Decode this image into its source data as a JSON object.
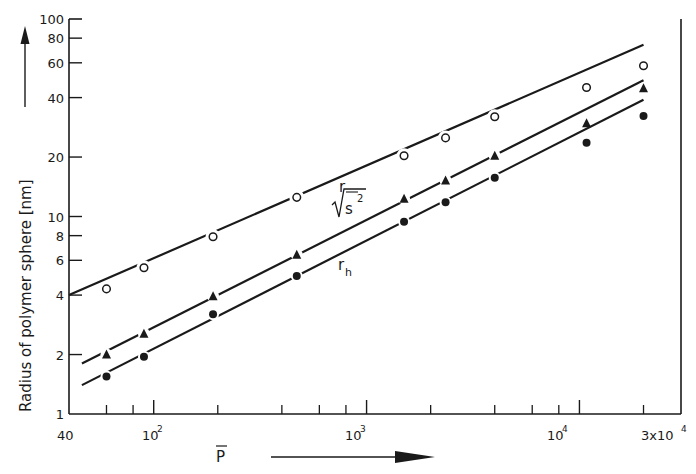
{
  "chart_data": {
    "type": "scatter",
    "title": "",
    "xlabel": "P̄",
    "ylabel": "Radius of polymer sphere [nm]",
    "xscale": "log",
    "yscale": "log",
    "xlim": [
      40,
      30000
    ],
    "ylim": [
      1,
      100
    ],
    "grid": false,
    "legend": "inline curve labels",
    "x_ticks_major": [
      {
        "value": 100,
        "label": "10²"
      },
      {
        "value": 1000,
        "label": "10³"
      },
      {
        "value": 10000,
        "label": "10⁴"
      }
    ],
    "x_tick_edge_labels": [
      {
        "value": 40,
        "label": "40"
      },
      {
        "value": 30000,
        "label": "3x10⁴"
      }
    ],
    "x_ticks_minor": [
      60,
      80,
      200,
      400,
      600,
      800,
      2000,
      4000,
      6000,
      8000,
      20000
    ],
    "y_ticks": [
      {
        "value": 1,
        "label": "1"
      },
      {
        "value": 2,
        "label": "2"
      },
      {
        "value": 4,
        "label": "4"
      },
      {
        "value": 6,
        "label": "6"
      },
      {
        "value": 8,
        "label": "8"
      },
      {
        "value": 10,
        "label": "10"
      },
      {
        "value": 20,
        "label": "20"
      },
      {
        "value": 40,
        "label": "40"
      },
      {
        "value": 60,
        "label": "60"
      },
      {
        "value": 80,
        "label": "80"
      },
      {
        "value": 100,
        "label": "100"
      }
    ],
    "x": [
      60,
      90,
      190,
      470,
      1500,
      2350,
      4000,
      10800,
      20000
    ],
    "series": [
      {
        "name": "r",
        "marker": "open-circle",
        "values": [
          4.3,
          5.5,
          7.9,
          12.5,
          20.3,
          25,
          32,
          45,
          58
        ],
        "fit_line": {
          "x": [
            40,
            20000
          ],
          "y": [
            4.0,
            74
          ]
        }
      },
      {
        "name": "√s̄²",
        "marker": "filled-triangle",
        "values": [
          2.0,
          2.55,
          3.95,
          6.4,
          12.3,
          15.2,
          20.3,
          29.7,
          44.6
        ],
        "fit_line": {
          "x": [
            46,
            20000
          ],
          "y": [
            1.8,
            49
          ]
        }
      },
      {
        "name": "r_h",
        "marker": "filled-circle",
        "values": [
          1.55,
          1.95,
          3.2,
          5.0,
          9.4,
          11.8,
          15.7,
          23.6,
          32.3
        ],
        "fit_line": {
          "x": [
            46,
            20000
          ],
          "y": [
            1.4,
            39
          ]
        }
      }
    ]
  },
  "labels": {
    "y_axis_title": "Radius of polymer sphere [nm]",
    "x_axis_title": "P",
    "curve_r": "r",
    "curve_s": "s",
    "curve_s_sup": "2",
    "curve_rh": "r",
    "curve_rh_sub": "h",
    "x_edge_left": "40",
    "x_102": "10",
    "x_103": "10",
    "x_104": "10",
    "x_exp2": "2",
    "x_exp3": "3",
    "x_exp4": "4",
    "x_edge_right": "3x10",
    "x_edge_right_exp": "4"
  }
}
